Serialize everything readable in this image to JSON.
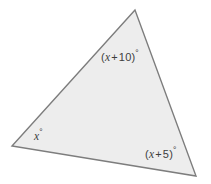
{
  "figure": {
    "type": "triangle-diagram",
    "background_color": "#ffffff",
    "fill_color": "#ededed",
    "stroke_color": "#7d7d7d",
    "stroke_width": 1.4,
    "label_color": "#3d3d3d",
    "vertices": {
      "apex": {
        "x": 135,
        "y": 10
      },
      "bottom_left": {
        "x": 12,
        "y": 146
      },
      "bottom_right": {
        "x": 196,
        "y": 176
      }
    },
    "polygon_points": "135,10 12,146 196,176"
  },
  "labels": {
    "top": {
      "full": "(x + 10)°",
      "open_paren": "(",
      "variable": "x",
      "operator": "+",
      "constant": "10",
      "close_paren": ")",
      "degree": "°"
    },
    "bottom_left": {
      "full": "x°",
      "variable": "x",
      "degree": "°"
    },
    "bottom_right": {
      "full": "(x + 5)°",
      "open_paren": "(",
      "variable": "x",
      "operator": "+",
      "constant": "5",
      "close_paren": ")",
      "degree": "°"
    }
  }
}
